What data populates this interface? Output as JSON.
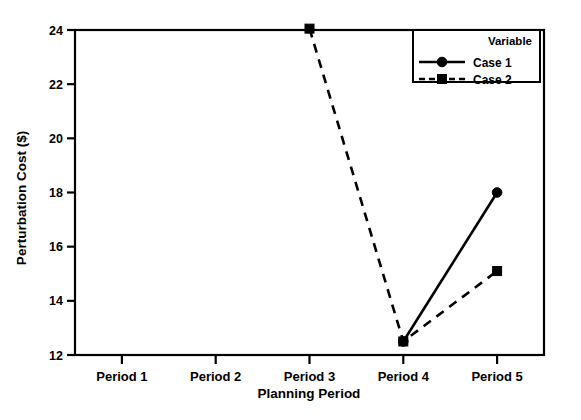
{
  "chart_data": {
    "type": "line",
    "title": "",
    "xlabel": "Planning Period",
    "ylabel": "Perturbation Cost ($)",
    "categories": [
      "Period 1",
      "Period 2",
      "Period 3",
      "Period 4",
      "Period 5"
    ],
    "ylim": [
      12,
      24
    ],
    "yticks": [
      12,
      14,
      16,
      18,
      20,
      22,
      24
    ],
    "ytick_labels": [
      "12",
      "14",
      "16",
      "18",
      "20",
      "22",
      "24"
    ],
    "grid": false,
    "legend": {
      "title": "Variable",
      "position": "top-right",
      "entries": [
        {
          "label": "Case 1",
          "marker": "circle",
          "line_style": "solid",
          "color": "#000000"
        },
        {
          "label": "Case 2",
          "marker": "square",
          "line_style": "dashed",
          "color": "#000000"
        }
      ]
    },
    "series": [
      {
        "name": "Case 1",
        "marker": "circle",
        "line_style": "solid",
        "color": "#000000",
        "x": [
          "Period 4",
          "Period 5"
        ],
        "values": [
          12.5,
          18.0
        ]
      },
      {
        "name": "Case 2",
        "marker": "square",
        "line_style": "dashed",
        "color": "#000000",
        "x": [
          "Period 3",
          "Period 4",
          "Period 5"
        ],
        "values": [
          24.05,
          12.5,
          15.1
        ]
      }
    ]
  },
  "colors": {
    "ink": "#000000",
    "background": "#ffffff"
  }
}
